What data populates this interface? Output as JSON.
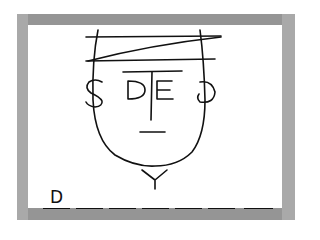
{
  "game": {
    "type": "hangman",
    "word_length": 7,
    "slots": [
      "D",
      "",
      "",
      "",
      "",
      "",
      ""
    ],
    "face_letters": {
      "left_ear": "S",
      "left_eye": "D",
      "right_eye": "E",
      "right_ear": "3",
      "neck": "Y"
    }
  },
  "colors": {
    "frame": "#a9a9a9",
    "frame_band": "#959595",
    "screen": "#ffffff",
    "ink": "#111111"
  }
}
